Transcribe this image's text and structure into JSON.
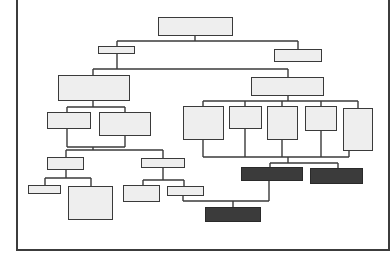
{
  "diagram": {
    "type": "org-chart / hierarchy tree",
    "colors": {
      "frame": "#3c3c3c",
      "node_fill": "#eeeeee",
      "node_border": "#3a3a3a",
      "highlight_fill": "#3b3b3b",
      "connector": "#3a3a3a",
      "background": "#ffffff"
    },
    "frame": {
      "x": 16,
      "y": -2,
      "w": 374,
      "h": 253
    },
    "nodes": [
      {
        "id": "root",
        "label": "",
        "x": 158,
        "y": 17,
        "w": 75,
        "h": 19,
        "dark": false
      },
      {
        "id": "l1-left",
        "label": "",
        "x": 98,
        "y": 46,
        "w": 37,
        "h": 8,
        "dark": false
      },
      {
        "id": "l1-right",
        "label": "",
        "x": 274,
        "y": 49,
        "w": 48,
        "h": 13,
        "dark": false
      },
      {
        "id": "l2-left",
        "label": "",
        "x": 58,
        "y": 75,
        "w": 72,
        "h": 26,
        "dark": false
      },
      {
        "id": "l2-right",
        "label": "",
        "x": 251,
        "y": 77,
        "w": 73,
        "h": 19,
        "dark": false
      },
      {
        "id": "l3-left-a",
        "label": "",
        "x": 47,
        "y": 112,
        "w": 44,
        "h": 17,
        "dark": false
      },
      {
        "id": "l3-left-b",
        "label": "",
        "x": 99,
        "y": 112,
        "w": 52,
        "h": 24,
        "dark": false
      },
      {
        "id": "l4-left",
        "label": "",
        "x": 47,
        "y": 157,
        "w": 37,
        "h": 13,
        "dark": false
      },
      {
        "id": "l4-right",
        "label": "",
        "x": 141,
        "y": 158,
        "w": 44,
        "h": 10,
        "dark": false
      },
      {
        "id": "l5-a",
        "label": "",
        "x": 28,
        "y": 185,
        "w": 33,
        "h": 9,
        "dark": false
      },
      {
        "id": "l5-b",
        "label": "",
        "x": 68,
        "y": 186,
        "w": 45,
        "h": 34,
        "dark": false
      },
      {
        "id": "l5-c",
        "label": "",
        "x": 123,
        "y": 185,
        "w": 37,
        "h": 17,
        "dark": false
      },
      {
        "id": "l5-d",
        "label": "",
        "x": 167,
        "y": 186,
        "w": 37,
        "h": 10,
        "dark": false
      },
      {
        "id": "r3-a",
        "label": "",
        "x": 183,
        "y": 106,
        "w": 41,
        "h": 34,
        "dark": false
      },
      {
        "id": "r3-b",
        "label": "",
        "x": 229,
        "y": 106,
        "w": 33,
        "h": 23,
        "dark": false
      },
      {
        "id": "r3-c",
        "label": "",
        "x": 267,
        "y": 106,
        "w": 31,
        "h": 34,
        "dark": false
      },
      {
        "id": "r3-d",
        "label": "",
        "x": 305,
        "y": 106,
        "w": 32,
        "h": 25,
        "dark": false
      },
      {
        "id": "r3-e",
        "label": "",
        "x": 343,
        "y": 108,
        "w": 30,
        "h": 43,
        "dark": false
      },
      {
        "id": "dark-a",
        "label": "",
        "x": 241,
        "y": 167,
        "w": 62,
        "h": 14,
        "dark": true
      },
      {
        "id": "dark-b",
        "label": "",
        "x": 310,
        "y": 168,
        "w": 53,
        "h": 16,
        "dark": true
      },
      {
        "id": "dark-c",
        "label": "",
        "x": 205,
        "y": 207,
        "w": 56,
        "h": 15,
        "dark": true
      }
    ],
    "connectors": [
      {
        "x1": 195,
        "y1": 36,
        "x2": 195,
        "y2": 41
      },
      {
        "x1": 117,
        "y1": 41,
        "x2": 298,
        "y2": 41
      },
      {
        "x1": 117,
        "y1": 41,
        "x2": 117,
        "y2": 46
      },
      {
        "x1": 298,
        "y1": 41,
        "x2": 298,
        "y2": 49
      },
      {
        "x1": 117,
        "y1": 54,
        "x2": 117,
        "y2": 69
      },
      {
        "x1": 93,
        "y1": 69,
        "x2": 288,
        "y2": 69
      },
      {
        "x1": 93,
        "y1": 69,
        "x2": 93,
        "y2": 75
      },
      {
        "x1": 288,
        "y1": 69,
        "x2": 288,
        "y2": 77
      },
      {
        "x1": 93,
        "y1": 101,
        "x2": 93,
        "y2": 107
      },
      {
        "x1": 67,
        "y1": 107,
        "x2": 125,
        "y2": 107
      },
      {
        "x1": 67,
        "y1": 107,
        "x2": 67,
        "y2": 112
      },
      {
        "x1": 125,
        "y1": 107,
        "x2": 125,
        "y2": 112
      },
      {
        "x1": 67,
        "y1": 129,
        "x2": 67,
        "y2": 147
      },
      {
        "x1": 125,
        "y1": 136,
        "x2": 125,
        "y2": 147
      },
      {
        "x1": 67,
        "y1": 147,
        "x2": 125,
        "y2": 147
      },
      {
        "x1": 93,
        "y1": 147,
        "x2": 93,
        "y2": 150
      },
      {
        "x1": 66,
        "y1": 150,
        "x2": 163,
        "y2": 150
      },
      {
        "x1": 66,
        "y1": 150,
        "x2": 66,
        "y2": 157
      },
      {
        "x1": 163,
        "y1": 150,
        "x2": 163,
        "y2": 158
      },
      {
        "x1": 66,
        "y1": 170,
        "x2": 66,
        "y2": 178
      },
      {
        "x1": 45,
        "y1": 178,
        "x2": 91,
        "y2": 178
      },
      {
        "x1": 45,
        "y1": 178,
        "x2": 45,
        "y2": 185
      },
      {
        "x1": 91,
        "y1": 178,
        "x2": 91,
        "y2": 186
      },
      {
        "x1": 163,
        "y1": 168,
        "x2": 163,
        "y2": 180
      },
      {
        "x1": 143,
        "y1": 180,
        "x2": 184,
        "y2": 180
      },
      {
        "x1": 143,
        "y1": 180,
        "x2": 143,
        "y2": 185
      },
      {
        "x1": 184,
        "y1": 180,
        "x2": 184,
        "y2": 186
      },
      {
        "x1": 288,
        "y1": 96,
        "x2": 288,
        "y2": 101
      },
      {
        "x1": 203,
        "y1": 101,
        "x2": 358,
        "y2": 101
      },
      {
        "x1": 203,
        "y1": 101,
        "x2": 203,
        "y2": 106
      },
      {
        "x1": 245,
        "y1": 101,
        "x2": 245,
        "y2": 106
      },
      {
        "x1": 282,
        "y1": 101,
        "x2": 282,
        "y2": 106
      },
      {
        "x1": 321,
        "y1": 101,
        "x2": 321,
        "y2": 106
      },
      {
        "x1": 358,
        "y1": 101,
        "x2": 358,
        "y2": 108
      },
      {
        "x1": 203,
        "y1": 140,
        "x2": 203,
        "y2": 157
      },
      {
        "x1": 245,
        "y1": 129,
        "x2": 245,
        "y2": 157
      },
      {
        "x1": 282,
        "y1": 140,
        "x2": 282,
        "y2": 157
      },
      {
        "x1": 321,
        "y1": 131,
        "x2": 321,
        "y2": 157
      },
      {
        "x1": 349,
        "y1": 151,
        "x2": 349,
        "y2": 157
      },
      {
        "x1": 203,
        "y1": 157,
        "x2": 349,
        "y2": 157
      },
      {
        "x1": 288,
        "y1": 157,
        "x2": 288,
        "y2": 163
      },
      {
        "x1": 270,
        "y1": 163,
        "x2": 338,
        "y2": 163
      },
      {
        "x1": 270,
        "y1": 163,
        "x2": 270,
        "y2": 167
      },
      {
        "x1": 338,
        "y1": 163,
        "x2": 338,
        "y2": 168
      },
      {
        "x1": 269,
        "y1": 181,
        "x2": 269,
        "y2": 201
      },
      {
        "x1": 183,
        "y1": 196,
        "x2": 183,
        "y2": 201
      },
      {
        "x1": 183,
        "y1": 201,
        "x2": 269,
        "y2": 201
      },
      {
        "x1": 233,
        "y1": 201,
        "x2": 233,
        "y2": 207
      }
    ]
  }
}
